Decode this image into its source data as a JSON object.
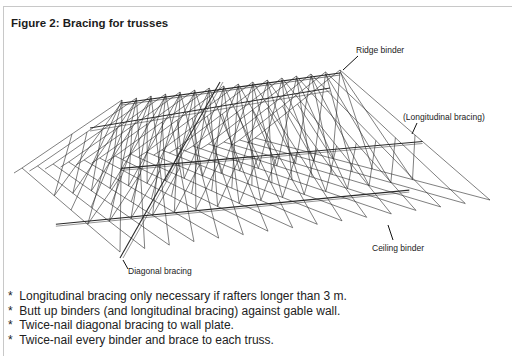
{
  "figure": {
    "title": "Figure 2: Bracing for trusses",
    "labels": {
      "ridge_binder": "Ridge binder",
      "longitudinal_bracing": "(Longitudinal bracing)",
      "ceiling_binder": "Ceiling binder",
      "diagonal_bracing": "Diagonal bracing"
    },
    "colors": {
      "line": "#2a2a2a",
      "frame": "#c8c8c8",
      "text": "#222222"
    }
  },
  "notes": {
    "bullet": "*",
    "items": [
      "Longitudinal bracing only necessary if rafters longer than 3 m.",
      "Butt up binders (and longitudinal bracing) against gable wall.",
      "Twice-nail diagonal bracing to wall plate.",
      "Twice-nail every binder and brace to each truss."
    ]
  }
}
